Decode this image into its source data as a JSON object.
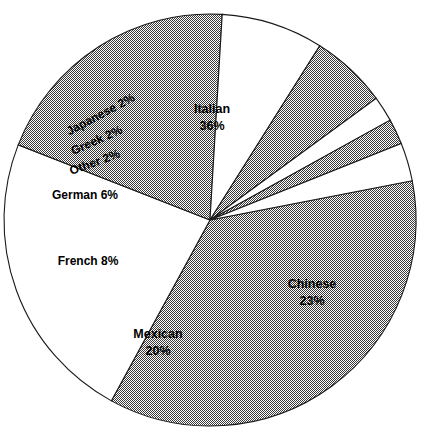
{
  "chart_data": {
    "type": "pie",
    "title": "",
    "subtitle": "",
    "xlabel": "",
    "ylabel": "",
    "legend_position": "none",
    "grid": false,
    "value_suffix": "%",
    "total": 99,
    "categories": [
      "Italian",
      "Chinese",
      "Mexican",
      "French",
      "German",
      "Other",
      "Greek",
      "Japanese"
    ],
    "values": [
      36,
      23,
      20,
      8,
      6,
      2,
      2,
      2
    ],
    "slices": [
      {
        "name": "Italian",
        "label": "Italian",
        "value": 36,
        "value_text": "36%",
        "fill": "hatch",
        "start_angle": 349,
        "end_angle": 478.6,
        "label_x": 212,
        "label_y": 110,
        "label_y2": 127,
        "label_rotation": 0,
        "two_line": true
      },
      {
        "name": "Chinese",
        "label": "Chinese",
        "value": 23,
        "value_text": "23%",
        "fill": "white",
        "start_angle": 478.6,
        "end_angle": 561.4,
        "label_x": 312,
        "label_y": 285,
        "label_y2": 302,
        "label_rotation": 0,
        "two_line": true
      },
      {
        "name": "Mexican",
        "label": "Mexican",
        "value": 20,
        "value_text": "20%",
        "fill": "hatch",
        "start_angle": 561.4,
        "end_angle": 633.4,
        "label_x": 158,
        "label_y": 335,
        "label_y2": 352,
        "label_rotation": 0,
        "two_line": true
      },
      {
        "name": "French",
        "label": "French 8%",
        "value": 8,
        "value_text": "8%",
        "fill": "white",
        "start_angle": 633.4,
        "end_angle": 662.2,
        "label_x": 88,
        "label_y": 262,
        "label_y2": 0,
        "label_rotation": 0,
        "two_line": false
      },
      {
        "name": "German",
        "label": "German 6%",
        "value": 6,
        "value_text": "6%",
        "fill": "hatch",
        "start_angle": 662.2,
        "end_angle": 683.8,
        "label_x": 85,
        "label_y": 196,
        "label_y2": 0,
        "label_rotation": 0,
        "two_line": false
      },
      {
        "name": "Other",
        "label": "Other 2%",
        "value": 2,
        "value_text": "2%",
        "fill": "white",
        "start_angle": 683.8,
        "end_angle": 691,
        "label_x": 95,
        "label_y": 163,
        "label_y2": 0,
        "label_rotation": -20,
        "two_line": false
      },
      {
        "name": "Greek",
        "label": "Greek 2%",
        "value": 2,
        "value_text": "2%",
        "fill": "hatch",
        "start_angle": 691,
        "end_angle": 698.2,
        "label_x": 97,
        "label_y": 141,
        "label_y2": 0,
        "label_rotation": -24,
        "two_line": false
      },
      {
        "name": "Japanese",
        "label": "Japanese 2%",
        "value": 2,
        "value_text": "2%",
        "fill": "white",
        "start_angle": 698.2,
        "end_angle": 709,
        "label_x": 101,
        "label_y": 115,
        "label_y2": 0,
        "label_rotation": -28,
        "two_line": false
      }
    ],
    "geometry": {
      "center_x": 210,
      "center_y": 220,
      "radius": 206
    },
    "colors": {
      "hatch_fill": "#808080",
      "white_fill": "#ffffff",
      "outline": "#1a1a1a",
      "label_text": "#000000",
      "background": "#ffffff"
    }
  }
}
